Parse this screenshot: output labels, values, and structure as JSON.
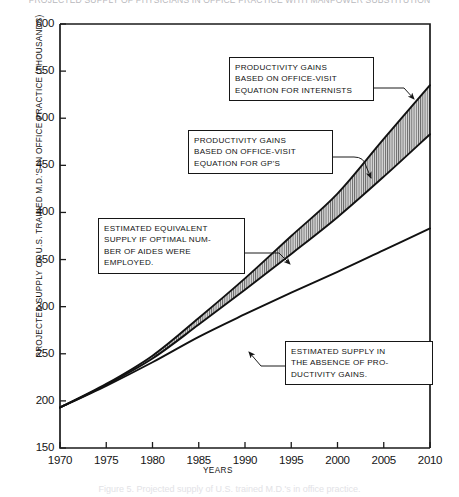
{
  "figure": {
    "top_title": "PROJECTED SUPPLY OF PHYSICIANS IN OFFICE PRACTICE WITH MANPOWER SUBSTITUTION",
    "bottom_caption": "Figure 5. Projected supply of U.S. trained M.D.'s in office practice.",
    "ylabel": "PROJECTED SUPPLY OF U.S. TRAINED M.D.'S IN OFFICE PRACTICE  (THOUSANDS)",
    "xlabel": "YEARS"
  },
  "callouts": {
    "internists": {
      "line1": "PRODUCTIVITY GAINS",
      "line2": "BASED ON OFFICE-VISIT",
      "line3": "EQUATION FOR INTERNISTS"
    },
    "gps": {
      "line1": "PRODUCTIVITY GAINS",
      "line2": "BASED ON OFFICE-VISIT",
      "line3": "EQUATION FOR GP'S"
    },
    "aides": {
      "line1": "ESTIMATED EQUIVALENT",
      "line2": "SUPPLY IF OPTIMAL NUM-",
      "line3": "BER OF AIDES WERE",
      "line4": "EMPLOYED."
    },
    "nogains": {
      "line1": "ESTIMATED SUPPLY IN",
      "line2": "THE ABSENCE OF PRO-",
      "line3": "DUCTIVITY GAINS."
    }
  },
  "chart_data": {
    "type": "line",
    "title": "PROJECTED SUPPLY OF PHYSICIANS IN OFFICE PRACTICE WITH MANPOWER SUBSTITUTION",
    "xlabel": "YEARS",
    "ylabel": "PROJECTED SUPPLY OF U.S. TRAINED M.D.'S IN OFFICE PRACTICE (THOUSANDS)",
    "xlim": [
      1970,
      2010
    ],
    "ylim": [
      150,
      600
    ],
    "xticks": [
      1970,
      1975,
      1980,
      1985,
      1990,
      1995,
      2000,
      2005,
      2010
    ],
    "yticks": [
      150,
      200,
      250,
      300,
      350,
      400,
      450,
      500,
      550,
      600
    ],
    "xtick_labels": [
      "1970",
      "1975",
      "1980",
      "1985",
      "1990",
      "1995",
      "2000",
      "2005",
      "2010"
    ],
    "ytick_labels": [
      "150",
      "200",
      "250",
      "300",
      "350",
      "400",
      "450",
      "500",
      "550",
      "600"
    ],
    "grid": false,
    "legend": "annotated callout boxes with leader lines",
    "shaded_band": {
      "between": [
        "Productivity gains based on office-visit equation for GP's",
        "Productivity gains based on office-visit equation for internists"
      ],
      "fill": "vertical hatch / light gray",
      "label": "Estimated equivalent supply if optimal number of aides were employed."
    },
    "x": [
      1970,
      1975,
      1980,
      1985,
      1990,
      1995,
      2000,
      2005,
      2010
    ],
    "series": [
      {
        "name": "Productivity gains based on office-visit equation for internists",
        "values": [
          193,
          218,
          248,
          288,
          330,
          375,
          420,
          478,
          535
        ]
      },
      {
        "name": "Productivity gains based on office-visit equation for GP's",
        "values": [
          193,
          217,
          245,
          281,
          318,
          356,
          395,
          438,
          483
        ]
      },
      {
        "name": "Estimated supply in the absence of productivity gains",
        "values": [
          193,
          216,
          241,
          268,
          292,
          315,
          337,
          360,
          383
        ]
      }
    ]
  },
  "colors": {
    "line": "#111111",
    "axis": "#1b1b1b",
    "band_fill": "#d9d9d9",
    "background": "#ffffff"
  }
}
